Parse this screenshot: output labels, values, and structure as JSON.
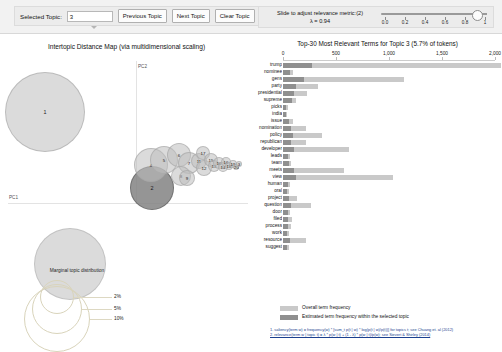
{
  "toolbar": {
    "selected_topic_label": "Selected Topic:",
    "selected_topic_value": "3",
    "previous_topic_label": "Previous Topic",
    "next_topic_label": "Next Topic",
    "clear_topic_label": "Clear Topic"
  },
  "slider": {
    "caption_line1": "Slide to adjust relevance metric:(2)",
    "caption_line2": "λ = 0.94",
    "value": 0.94,
    "ticks": [
      "0.0",
      "0.2",
      "0.4",
      "0.6",
      "0.8",
      "1"
    ]
  },
  "left_panel": {
    "title": "Intertopic Distance Map (via multidimensional scaling)",
    "x_axis_label": "PC1",
    "y_axis_label": "PC2",
    "legend": {
      "title": "Marginal topic distribution",
      "sizes": [
        "2%",
        "5%",
        "10%"
      ]
    },
    "topics": [
      {
        "id": "1",
        "cx": 45,
        "cy": 79,
        "r": 40,
        "selected": false
      },
      {
        "id": "2",
        "cx": 152,
        "cy": 155,
        "r": 22,
        "selected": true
      },
      {
        "id": "4",
        "cx": 151,
        "cy": 132,
        "r": 17,
        "selected": false
      },
      {
        "id": "5",
        "cx": 164,
        "cy": 127,
        "r": 14,
        "selected": false
      },
      {
        "id": "6",
        "cx": 179,
        "cy": 122,
        "r": 12,
        "selected": false
      },
      {
        "id": "7",
        "cx": 189,
        "cy": 130,
        "r": 11,
        "selected": false
      },
      {
        "id": "8",
        "cx": 181,
        "cy": 143,
        "r": 10,
        "selected": false
      },
      {
        "id": "9",
        "cx": 187,
        "cy": 145,
        "r": 8,
        "selected": false
      },
      {
        "id": "11",
        "cx": 199,
        "cy": 128,
        "r": 8,
        "selected": false
      },
      {
        "id": "12",
        "cx": 204,
        "cy": 135,
        "r": 8,
        "selected": false
      },
      {
        "id": "17",
        "cx": 203,
        "cy": 120,
        "r": 7,
        "selected": false
      },
      {
        "id": "15",
        "cx": 211,
        "cy": 127,
        "r": 7,
        "selected": false
      },
      {
        "id": "13",
        "cx": 214,
        "cy": 133,
        "r": 6,
        "selected": false
      },
      {
        "id": "10",
        "cx": 219,
        "cy": 130,
        "r": 6,
        "selected": false
      },
      {
        "id": "14",
        "cx": 223,
        "cy": 134,
        "r": 5,
        "selected": false
      },
      {
        "id": "16",
        "cx": 226,
        "cy": 129,
        "r": 5,
        "selected": false
      },
      {
        "id": "18",
        "cx": 229,
        "cy": 133,
        "r": 4,
        "selected": false
      },
      {
        "id": "19",
        "cx": 233,
        "cy": 131,
        "r": 4,
        "selected": false
      },
      {
        "id": "20",
        "cx": 236,
        "cy": 134,
        "r": 3,
        "selected": false
      },
      {
        "id": "3",
        "cx": 239,
        "cy": 131,
        "r": 3,
        "selected": false
      }
    ]
  },
  "bar_panel": {
    "title": "Top-30 Most Relevant Terms for Topic 3 (5.7% of tokens)",
    "legend_overall": "Overall term frequency",
    "legend_topic": "Estimated term frequency within the selected topic",
    "footnote_line1": "1. saliency(term w) = frequency(w) * [sum_t p(t | w) * log(p(t | w)/p(t))] for topics t; see Chuang et. al (2012)",
    "footnote_line2": "2. relevance(term w | topic t) = λ * p(w | t) + (1 - λ) * p(w | t)/p(w); see Sievert & Shirley (2014)"
  },
  "chart_data": {
    "type": "bar",
    "title": "Top-30 Most Relevant Terms for Topic 3 (5.7% of tokens)",
    "xlabel": "",
    "ylabel": "",
    "xlim": [
      0,
      2000
    ],
    "xticks": [
      0,
      500,
      1000,
      1500,
      2000
    ],
    "xtick_labels": [
      "0",
      "500",
      "1,000",
      "1,500",
      "2,000"
    ],
    "grid": false,
    "legend_position": "bottom-left",
    "orientation": "horizontal",
    "categories": [
      "trump",
      "nominee",
      "gens",
      "party",
      "presidential",
      "supreme",
      "picks",
      "india",
      "issue",
      "nomination",
      "policy",
      "republican",
      "developer",
      "leads",
      "team",
      "meets",
      "view",
      "human",
      "oral",
      "project",
      "question",
      "door",
      "filed",
      "process",
      "work",
      "resource",
      "suggest"
    ],
    "series": [
      {
        "name": "Overall term frequency",
        "values": [
          2060,
          95,
          1140,
          330,
          225,
          120,
          45,
          40,
          95,
          220,
          370,
          220,
          620,
          65,
          80,
          580,
          1040,
          70,
          55,
          130,
          260,
          70,
          85,
          75,
          55,
          215,
          60
        ]
      },
      {
        "name": "Estimated term frequency within the selected topic",
        "values": [
          270,
          70,
          200,
          125,
          100,
          85,
          30,
          28,
          60,
          80,
          95,
          80,
          100,
          45,
          55,
          105,
          120,
          50,
          40,
          60,
          78,
          45,
          50,
          45,
          38,
          65,
          40
        ]
      }
    ]
  }
}
